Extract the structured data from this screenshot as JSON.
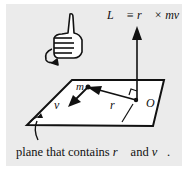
{
  "diagram": {
    "title_equation": "L⃗ ≡ r⃗ × mv⃗",
    "labels": {
      "mass": "m",
      "velocity": "v⃗",
      "position": "r⃗",
      "origin": "O"
    },
    "caption": {
      "prefix": "plane that contains ",
      "r": "r⃗",
      "middle": " and ",
      "v": "v⃗",
      "suffix": "."
    },
    "colors": {
      "panel": "#ebebeb",
      "plane": "#ffffff",
      "ink": "#111111"
    }
  }
}
